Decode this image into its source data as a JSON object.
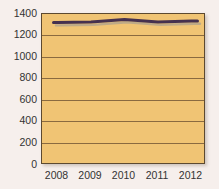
{
  "chart_data": {
    "type": "line",
    "x": [
      "2008",
      "2009",
      "2010",
      "2011",
      "2012"
    ],
    "series": [
      {
        "name": "series-1",
        "values": [
          1320,
          1325,
          1350,
          1325,
          1335
        ]
      }
    ],
    "title": "",
    "xlabel": "",
    "ylabel": "",
    "ylim": [
      0,
      1400
    ],
    "yticks": [
      0,
      200,
      400,
      600,
      800,
      1000,
      1200,
      1400
    ],
    "grid": true,
    "legend": false
  },
  "colors": {
    "page_bg": "#f6efec",
    "plot_bg": "#f0c474",
    "gridline": "#8a6a40",
    "plot_border": "#5c4930",
    "line": "#45314f",
    "line_shadow": "#b5a68a",
    "tick_text": "#333333"
  }
}
